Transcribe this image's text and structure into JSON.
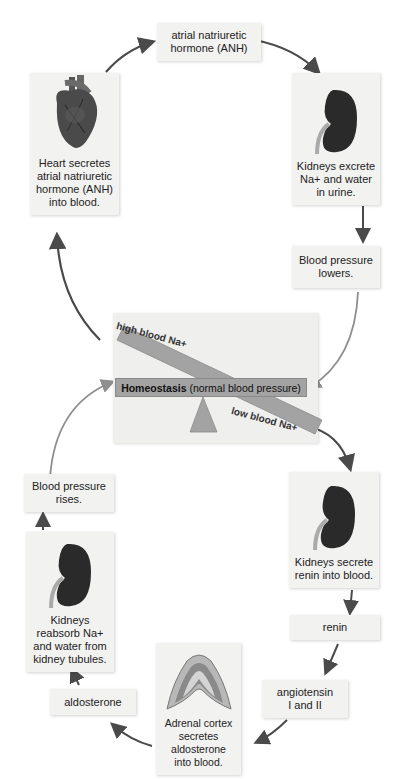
{
  "diagram": {
    "nodes": {
      "anh_hormone": {
        "label": "atrial natriuretic\nhormone (ANH)"
      },
      "heart": {
        "label": "Heart secretes\natrial natriuretic\nhormone (ANH)\ninto blood.",
        "icon": "heart-icon"
      },
      "kidney_excrete": {
        "label": "Kidneys excrete\nNa+ and water\nin urine.",
        "icon": "kidney-icon"
      },
      "bp_lowers": {
        "label": "Blood pressure\nlowers."
      },
      "bp_rises": {
        "label": "Blood pressure\nrises."
      },
      "kidney_reabsorb": {
        "label": "Kidneys\nreabsorb Na+\nand water from\nkidney tubules.",
        "icon": "kidney-icon"
      },
      "kidney_renin": {
        "label": "Kidneys secrete\nrenin into blood.",
        "icon": "kidney-icon"
      },
      "renin": {
        "label": "renin"
      },
      "angiotensin": {
        "label": "angiotensin\nI and II"
      },
      "adrenal": {
        "label": "Adrenal cortex\nsecretes\naldosterone\ninto blood.",
        "icon": "adrenal-cortex-icon"
      },
      "aldosterone": {
        "label": "aldosterone"
      }
    },
    "balance": {
      "homeostasis_bold": "Homeostasis",
      "homeostasis_rest": " (normal blood pressure)",
      "high_label": "high blood Na+",
      "low_label": "low blood Na+"
    },
    "colors": {
      "arrow": "#4a4a4a",
      "arrow_light": "#8e8e8e",
      "box_bg": "#f2f2f1",
      "beam": "#a4a3a3",
      "kidney": "#2a2a2a"
    }
  }
}
